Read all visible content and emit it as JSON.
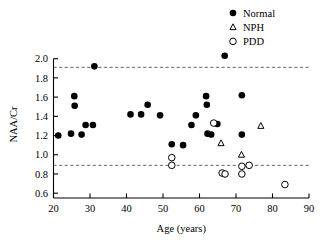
{
  "chart_data": {
    "type": "scatter",
    "title": "",
    "xlabel": "Age (years)",
    "ylabel": "NAA/Cr",
    "xlim": [
      20,
      90
    ],
    "ylim": [
      0.55,
      2.08
    ],
    "xticks": [
      20,
      30,
      40,
      50,
      60,
      70,
      80,
      90
    ],
    "yticks": [
      0.6,
      0.8,
      1.0,
      1.2,
      1.4,
      1.6,
      1.8,
      2.0
    ],
    "xtick_labels": [
      "20",
      "30",
      "40",
      "50",
      "60",
      "70",
      "80",
      "90"
    ],
    "ytick_labels": [
      "0.6",
      "0.8",
      "1.0",
      "1.2",
      "1.4",
      "1.6",
      "1.8",
      "2.0"
    ],
    "grid": false,
    "legend_position": "top-right",
    "reference_lines": [
      {
        "name": "upper-limit",
        "y": 1.91,
        "style": "dashed"
      },
      {
        "name": "lower-limit",
        "y": 0.89,
        "style": "dashed"
      }
    ],
    "series": [
      {
        "name": "Normal",
        "marker": "filled-circle",
        "color": "#000000",
        "points": [
          {
            "x": 21.3,
            "y": 1.2
          },
          {
            "x": 24.8,
            "y": 1.22
          },
          {
            "x": 25.7,
            "y": 1.61
          },
          {
            "x": 25.8,
            "y": 1.51
          },
          {
            "x": 27.7,
            "y": 1.21
          },
          {
            "x": 28.8,
            "y": 1.31
          },
          {
            "x": 30.8,
            "y": 1.31
          },
          {
            "x": 31.2,
            "y": 1.92
          },
          {
            "x": 41.1,
            "y": 1.42
          },
          {
            "x": 44.0,
            "y": 1.42
          },
          {
            "x": 45.8,
            "y": 1.52
          },
          {
            "x": 49.2,
            "y": 1.41
          },
          {
            "x": 52.4,
            "y": 1.11
          },
          {
            "x": 55.5,
            "y": 1.1
          },
          {
            "x": 57.8,
            "y": 1.31
          },
          {
            "x": 59.0,
            "y": 1.41
          },
          {
            "x": 61.8,
            "y": 1.61
          },
          {
            "x": 62.0,
            "y": 1.52
          },
          {
            "x": 62.2,
            "y": 1.22
          },
          {
            "x": 63.2,
            "y": 1.21
          },
          {
            "x": 64.9,
            "y": 1.32
          },
          {
            "x": 66.9,
            "y": 2.03
          },
          {
            "x": 71.6,
            "y": 1.62
          },
          {
            "x": 71.6,
            "y": 1.21
          }
        ]
      },
      {
        "name": "NPH",
        "marker": "open-triangle",
        "color": "#000000",
        "points": [
          {
            "x": 65.9,
            "y": 1.12
          },
          {
            "x": 71.5,
            "y": 1.0
          },
          {
            "x": 76.8,
            "y": 1.3
          }
        ]
      },
      {
        "name": "PDD",
        "marker": "open-circle",
        "color": "#000000",
        "points": [
          {
            "x": 52.4,
            "y": 0.97
          },
          {
            "x": 52.4,
            "y": 0.89
          },
          {
            "x": 63.9,
            "y": 1.33
          },
          {
            "x": 66.2,
            "y": 0.81
          },
          {
            "x": 67.0,
            "y": 0.8
          },
          {
            "x": 71.6,
            "y": 0.88
          },
          {
            "x": 71.6,
            "y": 0.8
          },
          {
            "x": 73.6,
            "y": 0.89
          },
          {
            "x": 83.4,
            "y": 0.69
          }
        ]
      }
    ]
  },
  "legend": {
    "entries": [
      {
        "label": "Normal",
        "marker": "filled-circle"
      },
      {
        "label": "NPH",
        "marker": "open-triangle"
      },
      {
        "label": "PDD",
        "marker": "open-circle"
      }
    ]
  }
}
